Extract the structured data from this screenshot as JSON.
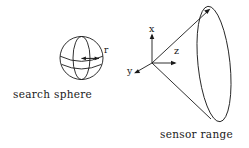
{
  "figure": {
    "width": 249,
    "height": 148,
    "background_color": "#ffffff",
    "stroke_color": "#1a1a1a",
    "text_color": "#1a1a1a"
  },
  "captions": {
    "search_sphere": "search sphere",
    "sensor_range": "sensor range"
  },
  "sphere": {
    "radius_label": "r",
    "center_x": 81.5,
    "center_y": 58,
    "radius": 21.5
  },
  "axes": {
    "origin_x": 152,
    "origin_y": 63,
    "labels": {
      "x": "x",
      "y": "y",
      "z": "z"
    }
  },
  "cone": {
    "apex_x": 152,
    "apex_y": 63,
    "base_center_x": 214,
    "base_center_y": 64,
    "base_rx": 16,
    "base_ry": 58,
    "base_rotation_deg": -6
  }
}
